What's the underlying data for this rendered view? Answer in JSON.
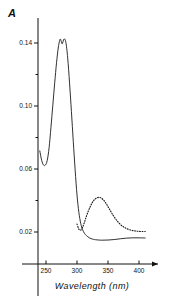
{
  "chart_data": {
    "type": "line",
    "title": "",
    "subtitle": "",
    "ylabel": "A",
    "xlabel": "Wavelength (nm)",
    "xlim": [
      235,
      410
    ],
    "ylim": [
      0.0,
      0.158
    ],
    "grid": false,
    "legend": false,
    "x_ticks_major": [
      250,
      300,
      350,
      400
    ],
    "x_tick_labels": [
      "250",
      "300",
      "350",
      "400"
    ],
    "y_ticks_major": [
      0.02,
      0.06,
      0.1,
      0.14
    ],
    "y_tick_labels": [
      "0.02",
      "0.06",
      "0.10",
      "0.14"
    ],
    "y_ticks_minor": [
      0.04,
      0.08,
      0.12
    ],
    "series": [
      {
        "name": "absorbance-solid",
        "style": "solid",
        "x": [
          240,
          243,
          246,
          249,
          252,
          255,
          258,
          261,
          264,
          267,
          270,
          273,
          276,
          279,
          282,
          285,
          288,
          291,
          294,
          297,
          300,
          303,
          306,
          309,
          312,
          315,
          320,
          325,
          330,
          340,
          350,
          360,
          370,
          380,
          390,
          400,
          410
        ],
        "y": [
          0.0715,
          0.0655,
          0.0625,
          0.0625,
          0.0655,
          0.0735,
          0.0865,
          0.1005,
          0.1145,
          0.1275,
          0.1375,
          0.1425,
          0.1395,
          0.1425,
          0.1405,
          0.1305,
          0.1145,
          0.0965,
          0.0775,
          0.0595,
          0.0435,
          0.0325,
          0.0255,
          0.0215,
          0.0192,
          0.0178,
          0.0163,
          0.0155,
          0.0151,
          0.0148,
          0.0149,
          0.0152,
          0.0157,
          0.0161,
          0.0163,
          0.0163,
          0.0162
        ]
      },
      {
        "name": "difference-dotted",
        "style": "dotted",
        "x": [
          300,
          303,
          306,
          309,
          312,
          315,
          318,
          321,
          324,
          327,
          330,
          333,
          336,
          339,
          342,
          345,
          348,
          351,
          354,
          357,
          360,
          364,
          368,
          372,
          376,
          380,
          385,
          390,
          395,
          400,
          405,
          410
        ],
        "y": [
          0.025,
          0.0218,
          0.0212,
          0.023,
          0.0262,
          0.0298,
          0.033,
          0.0358,
          0.0382,
          0.04,
          0.0412,
          0.0418,
          0.042,
          0.0416,
          0.0406,
          0.0392,
          0.0374,
          0.0354,
          0.0334,
          0.0314,
          0.0296,
          0.0274,
          0.0256,
          0.0241,
          0.023,
          0.0222,
          0.0214,
          0.0209,
          0.0206,
          0.0204,
          0.0203,
          0.0203
        ]
      }
    ],
    "annotations": []
  }
}
